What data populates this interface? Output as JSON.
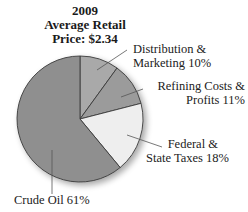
{
  "chart_data": {
    "type": "pie",
    "title": "2009 Average Retail Price: $2.34",
    "title_lines": [
      "2009",
      "Average Retail",
      "Price: $2.34"
    ],
    "start_angle_deg": 0,
    "direction": "clockwise",
    "slices": [
      {
        "name": "Distribution & Marketing",
        "value": 10,
        "color": "#a9a9a9",
        "label_lines": [
          "Distribution &",
          "Marketing 10%"
        ]
      },
      {
        "name": "Refining Costs & Profits",
        "value": 11,
        "color": "#9b9b9b",
        "label_lines": [
          "Refining Costs &",
          "Profits 11%"
        ]
      },
      {
        "name": "Federal & State Taxes",
        "value": 18,
        "color": "#eeeeee",
        "label_lines": [
          "Federal &",
          "State Taxes 18%"
        ]
      },
      {
        "name": "Crude Oil",
        "value": 61,
        "color": "#8f8f8f",
        "label_lines": [
          "Crude Oil 61%"
        ]
      }
    ],
    "unit": "%",
    "legend": "none (leader-line labels)"
  }
}
